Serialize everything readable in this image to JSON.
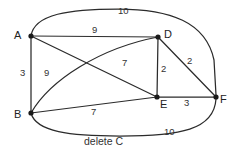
{
  "diagram": {
    "type": "weighted-undirected-graph",
    "caption": "delete C",
    "caption_pos": {
      "x": 84,
      "y": 136
    },
    "stroke_color": "#2b2b2b",
    "node_color": "#1a1a1a",
    "text_color": "#333333",
    "nodes": [
      {
        "id": "A",
        "label": "A",
        "x": 31,
        "y": 36,
        "label_x": 14,
        "label_y": 30
      },
      {
        "id": "B",
        "label": "B",
        "x": 31,
        "y": 113,
        "label_x": 14,
        "label_y": 109
      },
      {
        "id": "D",
        "label": "D",
        "x": 158,
        "y": 37,
        "label_x": 164,
        "label_y": 29
      },
      {
        "id": "E",
        "label": "E",
        "x": 157,
        "y": 97,
        "label_x": 160,
        "label_y": 99
      },
      {
        "id": "F",
        "label": "F",
        "x": 216,
        "y": 97,
        "label_x": 220,
        "label_y": 94
      }
    ],
    "edges": [
      {
        "id": "A-F",
        "from": "A",
        "to": "F",
        "weight": "10",
        "shape": "curve-top",
        "label_x": 118,
        "label_y": 6
      },
      {
        "id": "A-D",
        "from": "A",
        "to": "D",
        "weight": "9",
        "shape": "straight",
        "label_x": 92,
        "label_y": 25
      },
      {
        "id": "A-B",
        "from": "A",
        "to": "B",
        "weight": "3",
        "shape": "straight",
        "label_x": 20,
        "label_y": 68
      },
      {
        "id": "A-E",
        "from": "A",
        "to": "E",
        "weight": "7",
        "shape": "straight",
        "label_x": 122,
        "label_y": 58
      },
      {
        "id": "B-D",
        "from": "B",
        "to": "D",
        "weight": "9",
        "shape": "curve-arc",
        "label_x": 44,
        "label_y": 68
      },
      {
        "id": "B-E",
        "from": "B",
        "to": "E",
        "weight": "7",
        "shape": "straight",
        "label_x": 91,
        "label_y": 107
      },
      {
        "id": "B-F",
        "from": "B",
        "to": "F",
        "weight": "10",
        "shape": "curve-bottom",
        "label_x": 164,
        "label_y": 127
      },
      {
        "id": "D-E",
        "from": "D",
        "to": "E",
        "weight": "2",
        "shape": "straight",
        "label_x": 161,
        "label_y": 64
      },
      {
        "id": "D-F",
        "from": "D",
        "to": "F",
        "weight": "2",
        "shape": "straight",
        "label_x": 187,
        "label_y": 56
      },
      {
        "id": "E-F",
        "from": "E",
        "to": "F",
        "weight": "3",
        "shape": "straight",
        "label_x": 184,
        "label_y": 98
      }
    ],
    "paths": {
      "A-F": "M 31 36 C 34 14, 70 9, 118 9 C 170 9, 206 22, 214 60 L 216 95",
      "A-D": "M 31 36 L 158 37",
      "A-B": "M 31 36 L 31 113",
      "A-E": "M 31 36 L 157 97",
      "B-D": "M 31 113 C 50 80, 100 48, 158 37",
      "B-E": "M 31 113 L 157 97",
      "B-F": "M 31 113 C 36 132, 70 136, 120 136 C 180 136, 214 130, 216 99",
      "D-E": "M 158 37 L 157 97",
      "D-F": "M 158 37 L 216 97",
      "E-F": "M 157 97 L 216 97"
    }
  }
}
